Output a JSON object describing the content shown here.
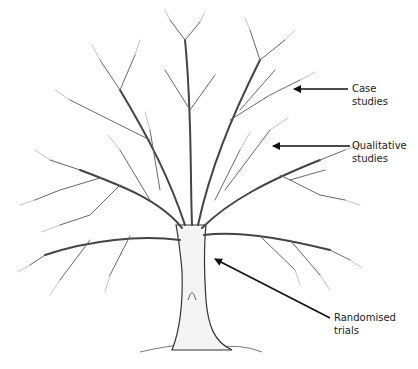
{
  "figure": {
    "labels": [
      {
        "id": "case",
        "line1": "Case",
        "line2": "studies"
      },
      {
        "id": "qualitative",
        "line1": "Qualitative",
        "line2": "studies"
      },
      {
        "id": "randomised",
        "line1": "Randomised",
        "line2": "trials"
      }
    ],
    "colors": {
      "ink": "#1a1a1a",
      "branch": "#555555",
      "twig": "#8a8a8a",
      "caption": "#9a9a9a"
    }
  }
}
